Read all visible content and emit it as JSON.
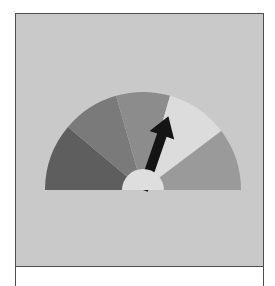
{
  "figure": {
    "title": ""
  },
  "gauge": {
    "center": [
      143,
      190
    ],
    "outer_radius": 98,
    "hub_radius": 21,
    "background_color": "#c9c9c9",
    "frame_border_color": "#4d4d4d",
    "segments": [
      {
        "name": "segment-1",
        "start_deg": 180,
        "end_deg": 140,
        "color": "#5e5e5e"
      },
      {
        "name": "segment-2",
        "start_deg": 140,
        "end_deg": 106,
        "color": "#7a7a7a"
      },
      {
        "name": "segment-3",
        "start_deg": 106,
        "end_deg": 74,
        "color": "#8c8c8c"
      },
      {
        "name": "segment-4",
        "start_deg": 74,
        "end_deg": 37,
        "color": "#dcdcdc"
      },
      {
        "name": "segment-5",
        "start_deg": 37,
        "end_deg": 0,
        "color": "#9a9a9a"
      }
    ],
    "hub_color": "#dedede",
    "needle": {
      "angle_deg": 71,
      "length": 78,
      "color": "#141414"
    }
  }
}
